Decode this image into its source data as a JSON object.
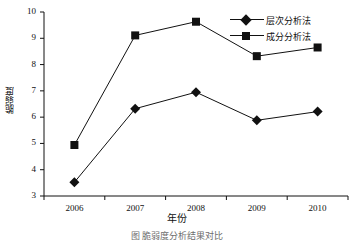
{
  "chart_data": {
    "type": "line",
    "title": "",
    "xlabel": "年份",
    "ylabel": "脆弱度",
    "categories": [
      "2006",
      "2007",
      "2008",
      "2009",
      "2010"
    ],
    "ylim": [
      3,
      10
    ],
    "yticks": [
      "3",
      "4",
      "5",
      "6",
      "7",
      "8",
      "9",
      "10"
    ],
    "grid": false,
    "legend_position": "top-right",
    "series": [
      {
        "name": "层次分析法",
        "marker": "diamond",
        "color": "#111111",
        "values": [
          3.52,
          6.32,
          6.95,
          5.88,
          6.21
        ]
      },
      {
        "name": "成分分析法",
        "marker": "square",
        "color": "#111111",
        "values": [
          4.94,
          9.11,
          9.63,
          8.32,
          8.65
        ]
      }
    ]
  },
  "caption": {
    "text": "图  脆弱度分析结果对比"
  },
  "axis": {
    "y_axis_label": "脆弱度",
    "x_axis_label": "年份"
  },
  "legend": {
    "items": [
      {
        "label": "层次分析法",
        "marker": "diamond-marker"
      },
      {
        "label": "成分分析法",
        "marker": "square-marker"
      }
    ]
  }
}
